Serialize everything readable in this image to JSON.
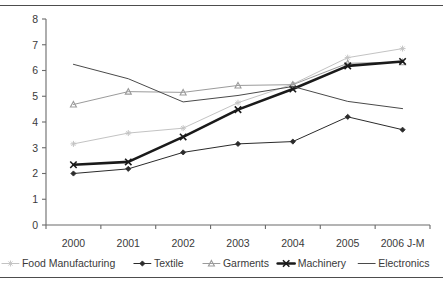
{
  "chart_data": {
    "type": "line",
    "title": "",
    "subtitle": "",
    "xlabel": "",
    "ylabel": "",
    "categories": [
      "2000",
      "2001",
      "2002",
      "2003",
      "2004",
      "2005",
      "2006 J-M"
    ],
    "ylim": [
      0,
      8
    ],
    "ytick_labels": [
      "0",
      "1",
      "2",
      "3",
      "4",
      "5",
      "6",
      "7",
      "8"
    ],
    "yticks": [
      0,
      1,
      2,
      3,
      4,
      5,
      6,
      7,
      8
    ],
    "grid": false,
    "legend_position": "bottom",
    "series": [
      {
        "name": "Food Manufacturing",
        "color": "#c3c3c3",
        "marker": "star",
        "line_width": 1,
        "values": [
          3.15,
          3.57,
          3.76,
          4.75,
          5.47,
          6.5,
          6.85
        ]
      },
      {
        "name": "Textile",
        "color": "#2b2b2b",
        "marker": "diamond",
        "line_width": 1,
        "values": [
          2.0,
          2.18,
          2.82,
          3.15,
          3.24,
          4.2,
          3.7
        ]
      },
      {
        "name": "Garments",
        "color": "#9b9b9b",
        "marker": "triangle",
        "line_width": 1,
        "values": [
          4.68,
          5.18,
          5.15,
          5.42,
          5.45,
          6.28,
          6.32
        ]
      },
      {
        "name": "Machinery",
        "color": "#1a1a1a",
        "marker": "cross",
        "line_width": 2.6,
        "values": [
          2.34,
          2.45,
          3.42,
          4.48,
          5.28,
          6.18,
          6.35
        ]
      },
      {
        "name": "Electronics",
        "color": "#4a4a4a",
        "marker": "none",
        "line_width": 1,
        "values": [
          6.24,
          5.68,
          4.78,
          5.03,
          5.38,
          4.8,
          4.52
        ]
      }
    ]
  }
}
